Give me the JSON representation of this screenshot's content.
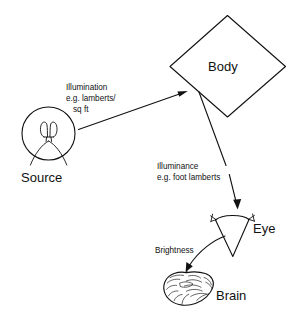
{
  "diagram": {
    "background_color": "#ffffff",
    "ink_color": "#111111",
    "nodes": [
      {
        "id": "source",
        "label": "Source",
        "icon": "light-bulb-icon",
        "shape": "circle-with-filament",
        "label_position": "below"
      },
      {
        "id": "body",
        "label": "Body",
        "icon": "diamond-shape-icon",
        "shape": "diamond",
        "label_position": "inside"
      },
      {
        "id": "eye",
        "label": "Eye",
        "icon": "eye-cone-icon",
        "shape": "cone-with-lashes",
        "label_position": "right"
      },
      {
        "id": "brain",
        "label": "Brain",
        "icon": "brain-icon",
        "shape": "brain-sketch",
        "label_position": "right"
      }
    ],
    "edges": [
      {
        "id": "source-to-body",
        "from": "source",
        "to": "body",
        "arrow": "straight",
        "label_lines": [
          "Illumination",
          "e.g. lamberts/",
          "sq ft"
        ]
      },
      {
        "id": "body-to-eye",
        "from": "body",
        "to": "eye",
        "arrow": "straight",
        "label_lines": [
          "Illuminance",
          "e.g. foot lamberts"
        ]
      },
      {
        "id": "eye-to-brain",
        "from": "eye",
        "to": "brain",
        "arrow": "curved",
        "label_lines": [
          "Brightness"
        ]
      }
    ]
  }
}
